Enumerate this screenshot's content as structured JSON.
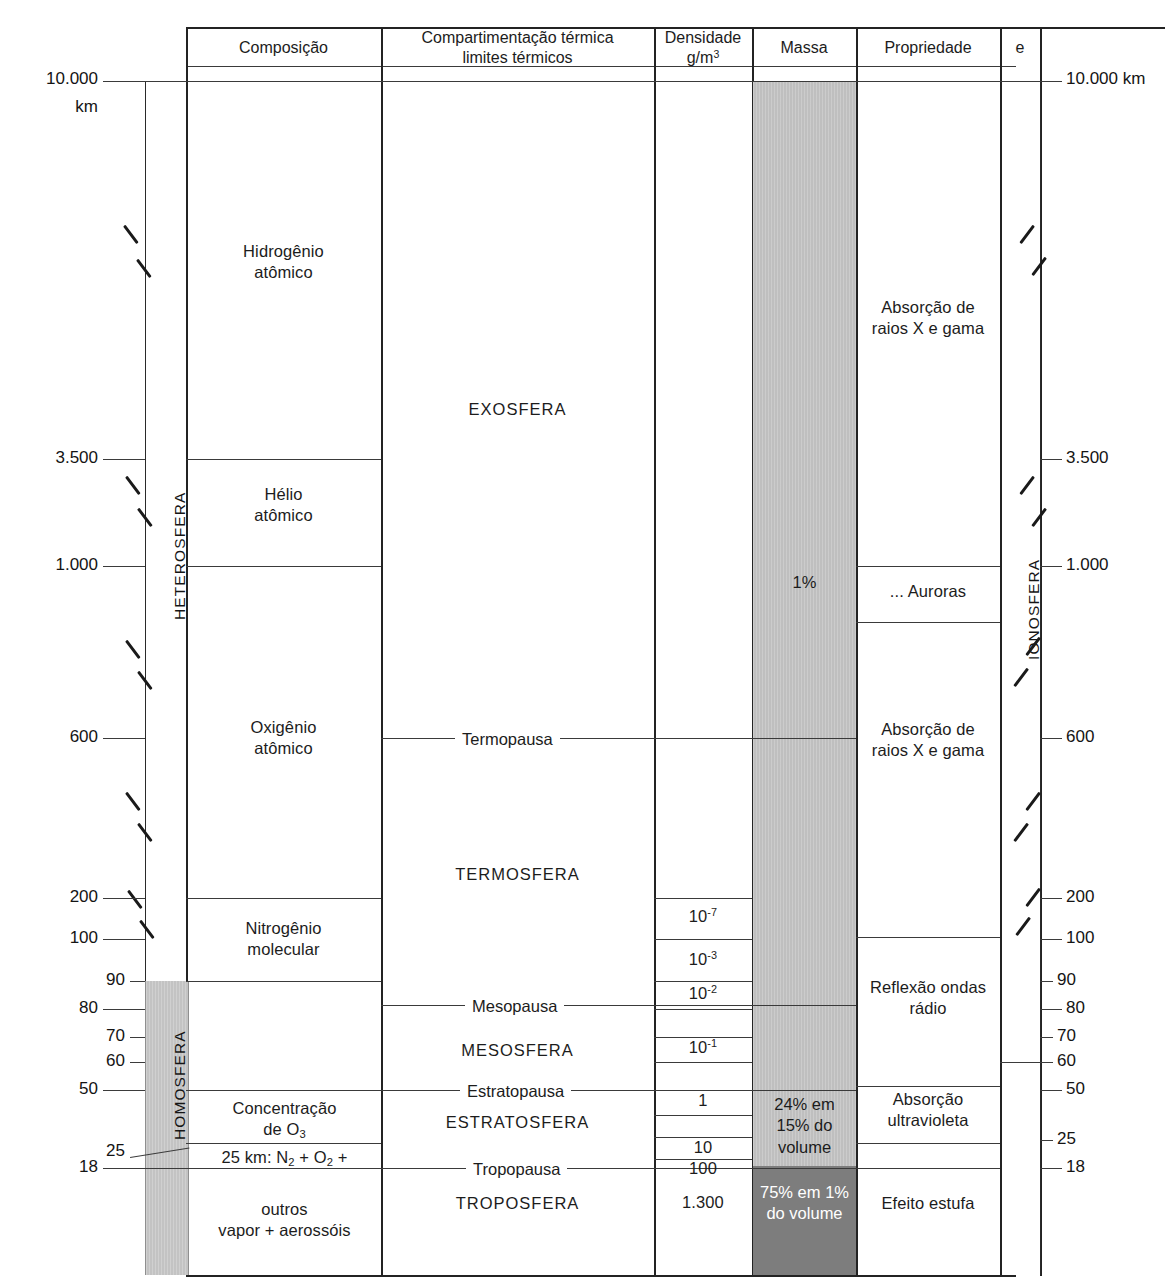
{
  "figure": {
    "unit_top_left": "10.000",
    "unit_top_left_2": "km",
    "unit_top_right": "10.000 km"
  },
  "headers": {
    "composicao": "Composição",
    "compartimentacao_l1": "Compartimentação térmica",
    "compartimentacao_l2": "limites térmicos",
    "densidade_l1": "Densidade",
    "densidade_l2": "g/m",
    "densidade_sup": "3",
    "massa": "Massa",
    "propriedade": "Propriedade",
    "e": "e"
  },
  "axis_left": {
    "ticks": [
      {
        "label": "10.000",
        "y": 81
      },
      {
        "label": "3.500",
        "y": 459
      },
      {
        "label": "1.000",
        "y": 566
      },
      {
        "label": "600",
        "y": 738
      },
      {
        "label": "200",
        "y": 898
      },
      {
        "label": "100",
        "y": 939
      },
      {
        "label": "90",
        "y": 981
      },
      {
        "label": "80",
        "y": 1009
      },
      {
        "label": "70",
        "y": 1037
      },
      {
        "label": "60",
        "y": 1062
      },
      {
        "label": "50",
        "y": 1090
      },
      {
        "label": "25",
        "y": 1152
      },
      {
        "label": "18",
        "y": 1168
      }
    ]
  },
  "axis_right": {
    "ticks": [
      {
        "label": "10.000 km",
        "y": 81
      },
      {
        "label": "3.500",
        "y": 459
      },
      {
        "label": "1.000",
        "y": 566
      },
      {
        "label": "600",
        "y": 738
      },
      {
        "label": "200",
        "y": 898
      },
      {
        "label": "100",
        "y": 939
      },
      {
        "label": "90",
        "y": 981
      },
      {
        "label": "80",
        "y": 1009
      },
      {
        "label": "70",
        "y": 1037
      },
      {
        "label": "60",
        "y": 1062
      },
      {
        "label": "50",
        "y": 1090
      },
      {
        "label": "25",
        "y": 1140
      },
      {
        "label": "18",
        "y": 1168
      }
    ]
  },
  "vertical_labels": {
    "heterosfera": "HETEROSFERA",
    "homosfera": "HOMOSFERA",
    "ionosfera": "IONOSFERA"
  },
  "composicao": [
    {
      "line1": "Hidrogênio",
      "line2": "atômico"
    },
    {
      "line1": "Hélio",
      "line2": "atômico"
    },
    {
      "line1": "Oxigênio",
      "line2": "atômico"
    },
    {
      "line1": "Nitrogênio",
      "line2": "molecular"
    },
    {
      "line1": "Concentração",
      "line2": "de O",
      "sub": "3"
    },
    {
      "line1": "25 km: N",
      "sub1": "2",
      "mid": " + O",
      "sub2": "2",
      "line1_end": " +"
    },
    {
      "line1": "outros",
      "line2": "vapor + aerossóis"
    }
  ],
  "camadas": [
    {
      "name": "EXOSFERA",
      "type": "layer",
      "y": 408
    },
    {
      "name": "Termopausa",
      "type": "boundary",
      "y": 738
    },
    {
      "name": "TERMOSFERA",
      "type": "layer",
      "y": 874
    },
    {
      "name": "Mesopausa",
      "type": "boundary",
      "y": 1005
    },
    {
      "name": "MESOSFERA",
      "type": "layer",
      "y": 1050
    },
    {
      "name": "Estratopausa",
      "type": "boundary",
      "y": 1088
    },
    {
      "name": "ESTRATOSFERA",
      "type": "layer",
      "y": 1122
    },
    {
      "name": "Tropopausa",
      "type": "boundary",
      "y": 1166
    },
    {
      "name": "TROPOSFERA",
      "type": "layer",
      "y": 1203
    }
  ],
  "densidade": [
    {
      "base": "10",
      "exp": "-7",
      "y": 917
    },
    {
      "base": "10",
      "exp": "-3",
      "y": 960
    },
    {
      "base": "10",
      "exp": "-2",
      "y": 994
    },
    {
      "base": "10",
      "exp": "-1",
      "y": 1048
    },
    {
      "base": "1",
      "exp": "",
      "y": 1101
    },
    {
      "base": "10",
      "exp": "",
      "y": 1148
    },
    {
      "base": "100",
      "exp": "",
      "y": 1169
    },
    {
      "base": "1.300",
      "exp": "",
      "y": 1203
    }
  ],
  "massa": {
    "one_percent": "1%",
    "strato_l1": "24% em",
    "strato_l2": "15% do",
    "strato_l3": "volume",
    "tropo_l1": "75% em 1%",
    "tropo_l2": "do volume"
  },
  "propriedade": [
    {
      "line1": "Absorção de",
      "line2": "raios X e gama",
      "y": 318
    },
    {
      "line1": "... Auroras",
      "line2": "",
      "y": 591
    },
    {
      "line1": "Absorção de",
      "line2": "raios X e gama",
      "y": 740
    },
    {
      "line1": "Reflexão  ondas",
      "line2": "rádio",
      "y": 998
    },
    {
      "line1": "Absorção",
      "line2": "ultravioleta",
      "y": 1110
    },
    {
      "line1": "Efeito estufa",
      "line2": "",
      "y": 1204
    }
  ],
  "colors": {
    "line": "#2a2a2a",
    "band_light": "#c3c3c3",
    "band_dark": "#7d7d7d",
    "text": "#1c1c1c"
  }
}
